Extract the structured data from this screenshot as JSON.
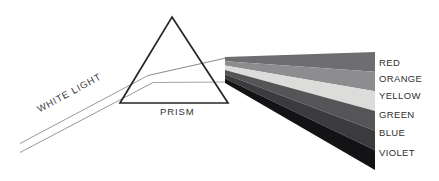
{
  "figure": {
    "width": 439,
    "height": 181,
    "background": "#ffffff"
  },
  "prism": {
    "label": "PRISM",
    "label_color": "#333335",
    "outline_color": "#262628",
    "apex": {
      "x": 172,
      "y": 17
    },
    "base_left": {
      "x": 120,
      "y": 103
    },
    "base_right": {
      "x": 228,
      "y": 103
    }
  },
  "incident_beam": {
    "label": "WHITE LIGHT",
    "label_color": "#3a3a3c",
    "ray_color": "#8c8c8e",
    "rotation_deg": -28.5,
    "start": {
      "x": 20,
      "y": 148
    },
    "end": {
      "x": 150,
      "y": 78
    }
  },
  "spectrum": {
    "origin": {
      "x": 225,
      "y": 57
    },
    "right_edge_x": 375,
    "bands": [
      {
        "name": "RED",
        "label": "RED",
        "color": "#6e6e70",
        "top_left_y": 57.0,
        "top_right_y": 52.0,
        "bottom_left_y": 61.3,
        "bottom_right_y": 71.7
      },
      {
        "name": "ORANGE",
        "label": "ORANGE",
        "color": "#8d8d8f",
        "top_left_y": 61.3,
        "top_right_y": 71.7,
        "bottom_left_y": 65.6,
        "bottom_right_y": 91.3
      },
      {
        "name": "YELLOW",
        "label": "YELLOW",
        "color": "#dcdcda",
        "top_left_y": 65.6,
        "top_right_y": 91.3,
        "bottom_left_y": 69.9,
        "bottom_right_y": 111.0
      },
      {
        "name": "GREEN",
        "label": "GREEN",
        "color": "#555557",
        "top_left_y": 69.9,
        "top_right_y": 111.0,
        "bottom_left_y": 74.2,
        "bottom_right_y": 130.7
      },
      {
        "name": "BLUE",
        "label": "BLUE",
        "color": "#3b3b3d",
        "top_left_y": 74.2,
        "top_right_y": 130.7,
        "bottom_left_y": 78.5,
        "bottom_right_y": 150.3
      },
      {
        "name": "VIOLET",
        "label": "VIOLET",
        "color": "#131315",
        "top_left_y": 78.5,
        "top_right_y": 150.3,
        "bottom_left_y": 83.0,
        "bottom_right_y": 170.0
      }
    ],
    "label_color": "#2f2f31"
  }
}
